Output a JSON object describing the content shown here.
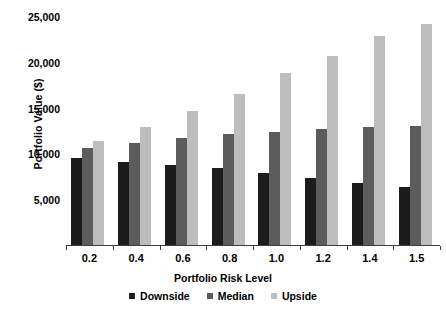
{
  "chart_data": {
    "type": "bar",
    "title": "",
    "xlabel": "Portfolio Risk Level",
    "ylabel": "Portfolio Value ($)",
    "categories": [
      "0.2",
      "0.4",
      "0.6",
      "0.8",
      "1.0",
      "1.2",
      "1.4",
      "1.5"
    ],
    "series": [
      {
        "name": "Downside",
        "color": "#1c1c1c",
        "values": [
          9600,
          9200,
          8800,
          8500,
          8000,
          7400,
          6900,
          6500
        ]
      },
      {
        "name": "Median",
        "color": "#5c5c5c",
        "values": [
          10700,
          11300,
          11800,
          12200,
          12500,
          12800,
          13000,
          13100
        ]
      },
      {
        "name": "Upside",
        "color": "#bdbdbd",
        "values": [
          11500,
          13000,
          14800,
          16600,
          18900,
          20800,
          22900,
          24200
        ]
      }
    ],
    "yticks": [
      5000,
      10000,
      15000,
      20000,
      25000
    ],
    "ytick_labels": [
      "5,000",
      "10,000",
      "15,000",
      "20,000",
      "25,000"
    ],
    "ylim": [
      0,
      26000
    ],
    "grid": true,
    "grid_color": "#ffffff",
    "legend_position": "bottom",
    "background": "#ffffff"
  }
}
